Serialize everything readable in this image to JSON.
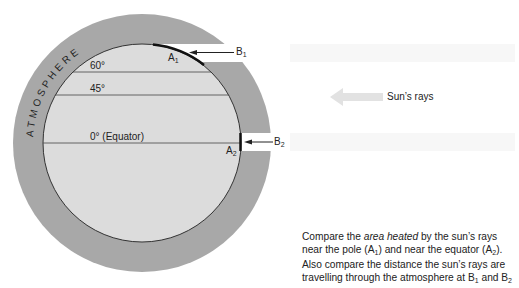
{
  "diagram": {
    "atmosphere_label": "ATMOSPHERE",
    "latitudes": [
      {
        "label": "60°"
      },
      {
        "label": "45°"
      },
      {
        "label": "0° (Equator)"
      }
    ],
    "points": {
      "a1": {
        "letter": "A",
        "sub": "1"
      },
      "a2": {
        "letter": "A",
        "sub": "2"
      },
      "b1": {
        "letter": "B",
        "sub": "1"
      },
      "b2": {
        "letter": "B",
        "sub": "2"
      }
    },
    "sun_rays_label": "Sun’s rays",
    "caption": {
      "part1": "Compare the ",
      "emph": "area heated",
      "part2": " by the sun’s rays near the pole (A",
      "sub1": "1",
      "part3": ") and near the equator (A",
      "sub2": "2",
      "part4": "). Also compare the distance the sun’s rays are travelling through the atmosphere at B",
      "sub3": "1",
      "part5": " and B",
      "sub4": "2"
    },
    "colors": {
      "atmosphere": "#a8a8a8",
      "earth": "#dcdcdc",
      "rays_band": "#f6f6f6",
      "sun_arrow": "#e2e2e2",
      "line": "#333333"
    }
  }
}
